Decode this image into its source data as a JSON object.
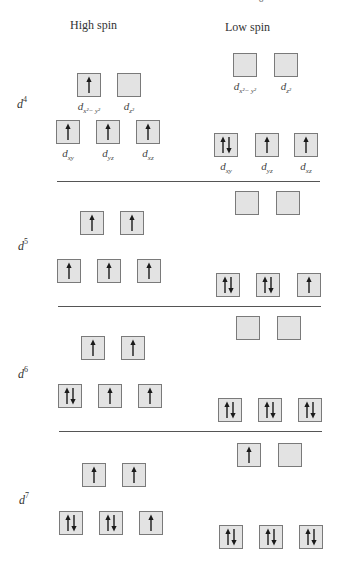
{
  "figure": {
    "top_cut_text": "…… ……… ……g……",
    "bottom_cut_text": "…… ……… ……… …… ……",
    "columns": [
      {
        "id": "high",
        "label": "High spin",
        "x": 96,
        "y": 20
      },
      {
        "id": "low",
        "label": "Low spin",
        "x": 248,
        "y": 22
      }
    ],
    "orbital_labels": {
      "dx2y2": {
        "base": "d",
        "sub": "x²− y²"
      },
      "dz2": {
        "base": "d",
        "sub": "z²"
      },
      "dxy": {
        "base": "d",
        "sub": "xy"
      },
      "dyz": {
        "base": "d",
        "sub": "yz"
      },
      "dxz": {
        "base": "d",
        "sub": "xz"
      }
    },
    "configurations": [
      {
        "label_base": "d",
        "label_exp": "4",
        "label_pos": [
          17,
          96
        ],
        "high": {
          "eg": [
            {
              "x": 77,
              "y": 73,
              "e": 1
            },
            {
              "x": 117,
              "y": 73,
              "e": 0
            }
          ],
          "t2g": [
            {
              "x": 56,
              "y": 120,
              "e": 1
            },
            {
              "x": 96,
              "y": 120,
              "e": 1
            },
            {
              "x": 136,
              "y": 120,
              "e": 1
            }
          ],
          "show_labels": true
        },
        "low": {
          "eg": [
            {
              "x": 233,
              "y": 53,
              "e": 0
            },
            {
              "x": 274,
              "y": 53,
              "e": 0
            }
          ],
          "t2g": [
            {
              "x": 214,
              "y": 133,
              "e": 2
            },
            {
              "x": 255,
              "y": 133,
              "e": 1
            },
            {
              "x": 294,
              "y": 133,
              "e": 1
            }
          ],
          "show_labels": true
        }
      },
      {
        "label_base": "d",
        "label_exp": "5",
        "label_pos": [
          18,
          238
        ],
        "high": {
          "eg": [
            {
              "x": 80,
              "y": 211,
              "e": 1
            },
            {
              "x": 120,
              "y": 211,
              "e": 1
            }
          ],
          "t2g": [
            {
              "x": 57,
              "y": 259,
              "e": 1
            },
            {
              "x": 97,
              "y": 259,
              "e": 1
            },
            {
              "x": 137,
              "y": 259,
              "e": 1
            }
          ]
        },
        "low": {
          "eg": [
            {
              "x": 235,
              "y": 191,
              "e": 0
            },
            {
              "x": 276,
              "y": 191,
              "e": 0
            }
          ],
          "t2g": [
            {
              "x": 216,
              "y": 273,
              "e": 2
            },
            {
              "x": 256,
              "y": 273,
              "e": 2
            },
            {
              "x": 297,
              "y": 273,
              "e": 1
            }
          ]
        }
      },
      {
        "label_base": "d",
        "label_exp": "6",
        "label_pos": [
          18,
          366
        ],
        "high": {
          "eg": [
            {
              "x": 81,
              "y": 336,
              "e": 1
            },
            {
              "x": 121,
              "y": 336,
              "e": 1
            }
          ],
          "t2g": [
            {
              "x": 58,
              "y": 384,
              "e": 2
            },
            {
              "x": 98,
              "y": 384,
              "e": 1
            },
            {
              "x": 138,
              "y": 384,
              "e": 1
            }
          ]
        },
        "low": {
          "eg": [
            {
              "x": 236,
              "y": 316,
              "e": 0
            },
            {
              "x": 277,
              "y": 316,
              "e": 0
            }
          ],
          "t2g": [
            {
              "x": 218,
              "y": 398,
              "e": 2
            },
            {
              "x": 258,
              "y": 398,
              "e": 2
            },
            {
              "x": 298,
              "y": 398,
              "e": 2
            }
          ]
        }
      },
      {
        "label_base": "d",
        "label_exp": "7",
        "label_pos": [
          19,
          492
        ],
        "high": {
          "eg": [
            {
              "x": 82,
              "y": 463,
              "e": 1
            },
            {
              "x": 122,
              "y": 463,
              "e": 1
            }
          ],
          "t2g": [
            {
              "x": 59,
              "y": 511,
              "e": 2
            },
            {
              "x": 99,
              "y": 511,
              "e": 2
            },
            {
              "x": 139,
              "y": 511,
              "e": 1
            }
          ]
        },
        "low": {
          "eg": [
            {
              "x": 237,
              "y": 443,
              "e": 1
            },
            {
              "x": 278,
              "y": 443,
              "e": 0
            }
          ],
          "t2g": [
            {
              "x": 219,
              "y": 525,
              "e": 2
            },
            {
              "x": 259,
              "y": 525,
              "e": 2
            },
            {
              "x": 299,
              "y": 525,
              "e": 2
            }
          ]
        }
      }
    ],
    "dividers": [
      {
        "x1": 57,
        "x2": 320,
        "y": 181
      },
      {
        "x1": 58,
        "x2": 321,
        "y": 306
      },
      {
        "x1": 59,
        "x2": 322,
        "y": 431
      }
    ],
    "colors": {
      "box_fill": "#e3e3e3",
      "box_border": "#7a7a7a",
      "arrow": "#1a1a1a",
      "divider": "#555555"
    }
  }
}
